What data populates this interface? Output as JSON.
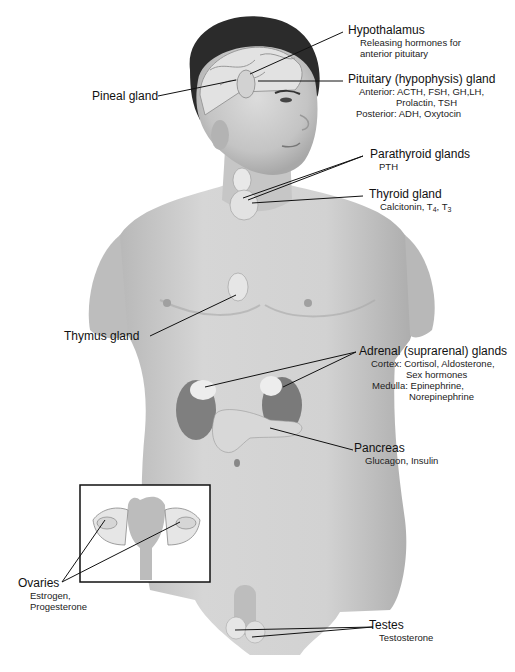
{
  "figure": {
    "labels": {
      "hypothalamus": {
        "name": "Hypothalamus",
        "hormones": [
          "Releasing hormones for",
          "anterior pituitary"
        ]
      },
      "pineal": {
        "name": "Pineal gland"
      },
      "pituitary": {
        "name": "Pituitary (hypophysis) gland",
        "anterior": "Anterior: ACTH, FSH, GH,LH,",
        "anterior_cont": "Prolactin, TSH",
        "posterior": "Posterior: ADH, Oxytocin"
      },
      "parathyroid": {
        "name": "Parathyroid glands",
        "hormones": "PTH"
      },
      "thyroid": {
        "name": "Thyroid gland",
        "hormones_prefix": "Calcitonin, T",
        "t4_sub": "4",
        "sep": ", T",
        "t3_sub": "3"
      },
      "thymus": {
        "name": "Thymus gland"
      },
      "adrenal": {
        "name": "Adrenal (suprarenal) glands",
        "cortex": "Cortex: Cortisol, Aldosterone,",
        "cortex_cont": "Sex hormones",
        "medulla": "Medulla: Epinephrine,",
        "medulla_cont": "Norepinephrine"
      },
      "pancreas": {
        "name": "Pancreas",
        "hormones": "Glucagon, Insulin"
      },
      "ovaries": {
        "name": "Ovaries",
        "hormones": [
          "Estrogen,",
          "Progesterone"
        ]
      },
      "testes": {
        "name": "Testes",
        "hormones": "Testosterone"
      }
    },
    "colors": {
      "skin": "#c9c9c9",
      "skin_dark": "#9a9a9a",
      "hair": "#2b2b2b",
      "gland": "#e6e6e6",
      "kidney": "#7d7d7d",
      "line": "#111111"
    }
  }
}
